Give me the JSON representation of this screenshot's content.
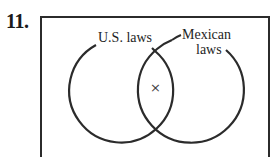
{
  "problem": {
    "number": "11."
  },
  "venn": {
    "sets": [
      {
        "label": "U.S. laws"
      },
      {
        "label_line1": "Mexican",
        "label_line2": "laws"
      }
    ],
    "intersection_mark": "×"
  },
  "colors": {
    "stroke": "#2b2b2b",
    "text": "#1e1e1e",
    "background": "#ffffff"
  }
}
